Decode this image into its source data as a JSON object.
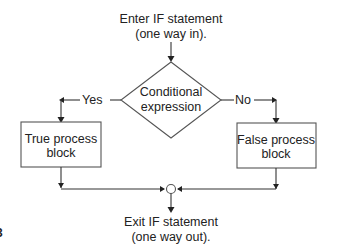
{
  "diagram": {
    "entry_label": [
      "Enter IF statement",
      "(one way in)."
    ],
    "decision_label": [
      "Conditional",
      "expression"
    ],
    "yes_label": "Yes",
    "no_label": "No",
    "true_block_label": [
      "True process",
      "block"
    ],
    "false_block_label": [
      "False process",
      "block"
    ],
    "exit_label": [
      "Exit IF statement",
      "(one way out)."
    ],
    "margin_mark": "3"
  }
}
